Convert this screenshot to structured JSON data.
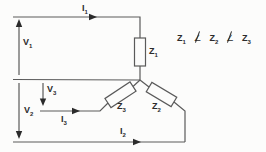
{
  "diagram": {
    "labels": {
      "i1": {
        "base": "I",
        "sub": "1"
      },
      "v1": {
        "base": "V",
        "sub": "1"
      },
      "v2": {
        "base": "V",
        "sub": "2"
      },
      "v3": {
        "base": "V",
        "sub": "3"
      },
      "i3": {
        "base": "I",
        "sub": "3"
      },
      "i2": {
        "base": "I",
        "sub": "2"
      },
      "z1": {
        "base": "Z",
        "sub": "1"
      },
      "z2": {
        "base": "Z",
        "sub": "2"
      },
      "z3": {
        "base": "Z",
        "sub": "3"
      }
    },
    "inequality": {
      "text": "Z1 ∠̸ Z2 ∠̸ Z3",
      "operator": "∠",
      "operator_negated": true,
      "terms": [
        {
          "base": "Z",
          "sub": "1"
        },
        {
          "base": "Z",
          "sub": "2"
        },
        {
          "base": "Z",
          "sub": "3"
        }
      ]
    },
    "colors": {
      "wire": "#5a5a5a",
      "arrow": "#2b2b2b",
      "text": "#2b2b2b",
      "background": "#fcfcfb"
    },
    "icons": {
      "angle_not_equal": "∠̸ (angle symbol with slash = not equal)"
    }
  }
}
